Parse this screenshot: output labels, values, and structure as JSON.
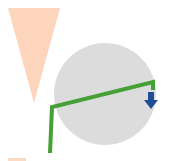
{
  "diagram": {
    "background": "#ffffff",
    "shapes": {
      "triangle": {
        "kind": "inverted-triangle",
        "color": "#fdd5bd",
        "points": [
          [
            8,
            8
          ],
          [
            60,
            8
          ],
          [
            34,
            103
          ]
        ]
      },
      "circle": {
        "kind": "circle",
        "color": "#dcdcdc",
        "cx": 105,
        "cy": 94,
        "r": 51
      },
      "connector": {
        "kind": "polyline",
        "color": "#45a035",
        "width": 4,
        "points": [
          [
            50,
            153
          ],
          [
            52,
            107
          ],
          [
            153,
            82
          ],
          [
            153,
            90
          ]
        ]
      },
      "arrow": {
        "kind": "down-arrow",
        "color": "#1f4e96",
        "x": 151,
        "y": 93
      }
    },
    "bottom_strip": {
      "color": "#fcd9c2"
    }
  }
}
